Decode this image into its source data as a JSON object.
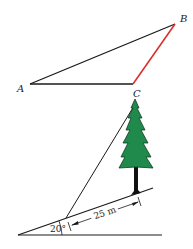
{
  "triangle": {
    "vertices": [
      {
        "label": "A",
        "x": 30,
        "y": 84
      },
      {
        "label": "B",
        "x": 175,
        "y": 24
      },
      {
        "label": "C",
        "x": 133,
        "y": 84
      }
    ],
    "highlight_side": "BC",
    "highlight_color": "#d9302c",
    "line_color": "#1a1a1a"
  },
  "tree_figure": {
    "angle_label": "20°",
    "distance_label": "25 m",
    "tree_color": "#1f8a4c",
    "trunk_color": "#111111"
  }
}
